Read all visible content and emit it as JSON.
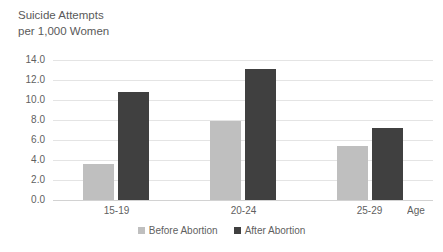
{
  "chart_data": {
    "type": "bar",
    "title": "Suicide Attempts per 1,000 Women",
    "title_lines": [
      "Suicide Attempts",
      "per 1,000 Women"
    ],
    "categories": [
      "15-19",
      "20-24",
      "25-29"
    ],
    "series": [
      {
        "name": "Before Abortion",
        "color": "#bfbfbf",
        "values": [
          3.6,
          7.9,
          5.4
        ]
      },
      {
        "name": "After Abortion",
        "color": "#404040",
        "values": [
          10.8,
          13.1,
          7.2
        ]
      }
    ],
    "xlabel": "Age",
    "ylabel": "",
    "ylim": [
      0.0,
      14.0
    ],
    "ytick_step": 2.0,
    "ytick_labels": [
      "14.0",
      "12.0",
      "10.0",
      "8.0",
      "6.0",
      "4.0",
      "2.0",
      "0.0"
    ],
    "grid": true,
    "legend_position": "bottom"
  },
  "legend": {
    "items": [
      {
        "label": "Before Abortion",
        "color": "#bfbfbf"
      },
      {
        "label": "After Abortion",
        "color": "#404040"
      }
    ]
  },
  "axis": {
    "x_title": "Age"
  },
  "colors": {
    "background": "#ffffff",
    "gridline": "#e4e4e4",
    "baseline": "#d2d2d2",
    "text": "#5f5f5f",
    "before_abortion": "#bfbfbf",
    "after_abortion": "#404040"
  }
}
